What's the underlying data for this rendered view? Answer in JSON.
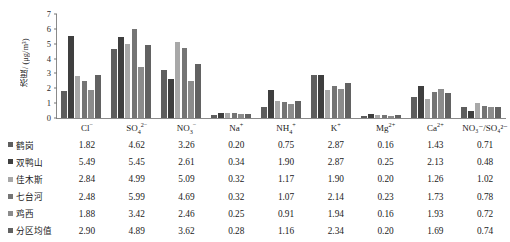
{
  "chart_data": {
    "type": "bar",
    "title": "",
    "xlabel": "",
    "ylabel": "浓度/ (μg/m³)",
    "ylim": [
      0,
      7
    ],
    "yticks": [
      0,
      1,
      2,
      3,
      4,
      5,
      6,
      7
    ],
    "grid": false,
    "legend_position": "table-left",
    "categories": [
      "Cl⁻",
      "SO₄²⁻",
      "NO₃⁻",
      "Na⁺",
      "NH₄⁺",
      "K⁺",
      "Mg²⁺",
      "Ca²⁺",
      "NO₃⁻/SO₄²⁻"
    ],
    "series": [
      {
        "name": "鹤岗",
        "color": "#5e5e5e",
        "values": [
          1.82,
          4.62,
          3.26,
          0.2,
          0.75,
          2.87,
          0.16,
          1.43,
          0.71
        ]
      },
      {
        "name": "双鸭山",
        "color": "#3f3f3f",
        "values": [
          5.49,
          5.45,
          2.61,
          0.34,
          1.9,
          2.87,
          0.25,
          2.13,
          0.48
        ]
      },
      {
        "name": "佳木斯",
        "color": "#a8a8a8",
        "values": [
          2.84,
          4.99,
          5.09,
          0.32,
          1.17,
          1.9,
          0.2,
          1.26,
          1.02
        ]
      },
      {
        "name": "七台河",
        "color": "#757575",
        "values": [
          2.48,
          5.99,
          4.69,
          0.32,
          1.07,
          2.14,
          0.23,
          1.73,
          0.78
        ]
      },
      {
        "name": "鸡西",
        "color": "#8c8c8c",
        "values": [
          1.88,
          3.42,
          2.46,
          0.25,
          0.91,
          1.94,
          0.16,
          1.93,
          0.72
        ]
      },
      {
        "name": "分区均值",
        "color": "#626262",
        "values": [
          2.9,
          4.89,
          3.62,
          0.28,
          1.16,
          2.34,
          0.2,
          1.69,
          0.74
        ]
      }
    ]
  },
  "table": {
    "header_blank": "",
    "columns": [
      {
        "label_main": "Cl",
        "sup": "−",
        "sub": ""
      },
      {
        "label_main": "SO",
        "sub": "4",
        "sup": "2−"
      },
      {
        "label_main": "NO",
        "sub": "3",
        "sup": "−"
      },
      {
        "label_main": "Na",
        "sup": "+",
        "sub": ""
      },
      {
        "label_main": "NH",
        "sub": "4",
        "sup": "+"
      },
      {
        "label_main": "K",
        "sup": "+",
        "sub": ""
      },
      {
        "label_main": "Mg",
        "sup": "2+",
        "sub": ""
      },
      {
        "label_main": "Ca",
        "sup": "2+",
        "sub": ""
      },
      {
        "label_main": "NO₃⁻/SO₄²⁻",
        "sup": "",
        "sub": ""
      }
    ],
    "rows": [
      {
        "legend": "鹤岗",
        "color": "#5e5e5e",
        "values": [
          "1.82",
          "4.62",
          "3.26",
          "0.20",
          "0.75",
          "2.87",
          "0.16",
          "1.43",
          "0.71"
        ]
      },
      {
        "legend": "双鸭山",
        "color": "#3f3f3f",
        "values": [
          "5.49",
          "5.45",
          "2.61",
          "0.34",
          "1.90",
          "2.87",
          "0.25",
          "2.13",
          "0.48"
        ]
      },
      {
        "legend": "佳木斯",
        "color": "#a8a8a8",
        "values": [
          "2.84",
          "4.99",
          "5.09",
          "0.32",
          "1.17",
          "1.90",
          "0.20",
          "1.26",
          "1.02"
        ]
      },
      {
        "legend": "七台河",
        "color": "#757575",
        "values": [
          "2.48",
          "5.99",
          "4.69",
          "0.32",
          "1.07",
          "2.14",
          "0.23",
          "1.73",
          "0.78"
        ]
      },
      {
        "legend": "鸡西",
        "color": "#8c8c8c",
        "values": [
          "1.88",
          "3.42",
          "2.46",
          "0.25",
          "0.91",
          "1.94",
          "0.16",
          "1.93",
          "0.72"
        ]
      },
      {
        "legend": "分区均值",
        "color": "#626262",
        "values": [
          "2.90",
          "4.89",
          "3.62",
          "0.28",
          "1.16",
          "2.34",
          "0.20",
          "1.69",
          "0.74"
        ]
      }
    ]
  }
}
